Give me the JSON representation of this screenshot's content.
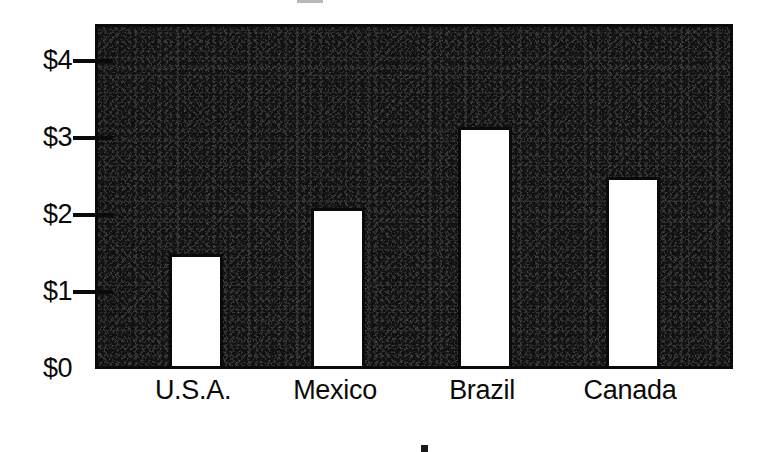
{
  "chart_data": {
    "type": "bar",
    "title": "",
    "subtitle": "",
    "xlabel": "",
    "ylabel": "",
    "categories": [
      "U.S.A.",
      "Mexico",
      "Brazil",
      "Canada"
    ],
    "values": [
      1.45,
      2.05,
      3.1,
      2.45
    ],
    "value_prefix": "$",
    "ylim": [
      0,
      4.5
    ],
    "yticks": [
      0,
      1,
      2,
      3,
      4
    ],
    "ytick_labels": [
      "$0",
      "$1",
      "$2",
      "$3",
      "$4"
    ],
    "grid": false,
    "legend": null,
    "legend_position": "none",
    "series": [
      {
        "name": "",
        "values": [
          1.45,
          2.05,
          3.1,
          2.45
        ]
      }
    ],
    "style": {
      "plot_background": "#3b3b3b",
      "bar_fill": "#ffffff",
      "bar_border": "#0a0a0a",
      "axis_color": "#0a0a0a",
      "text_color": "#0a0a0a",
      "page_background": "#ffffff"
    },
    "annotations": []
  },
  "axis": {
    "y_labels": [
      {
        "text": "$4",
        "value": 4
      },
      {
        "text": "$3",
        "value": 3
      },
      {
        "text": "$2",
        "value": 2
      },
      {
        "text": "$1",
        "value": 1
      },
      {
        "text": "$0",
        "value": 0
      }
    ],
    "x_labels": [
      {
        "text": "U.S.A."
      },
      {
        "text": "Mexico"
      },
      {
        "text": "Brazil"
      },
      {
        "text": "Canada"
      }
    ]
  }
}
